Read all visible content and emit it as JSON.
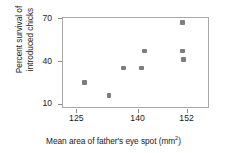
{
  "chart_data": {
    "type": "scatter",
    "title": "",
    "xlabel": "Mean area of father's eye spot (mm2)",
    "xlabel_text": "Mean area of father's eye spot (mm",
    "xlabel_sup": "2",
    "xlabel_tail": ")",
    "ylabel": "Percent survival of\nintroduced chicks",
    "xlim": [
      121.5,
      157.5
    ],
    "ylim": [
      7,
      71
    ],
    "xticks": [
      125,
      140,
      152
    ],
    "yticks": [
      10,
      40,
      70
    ],
    "xtick_labels": [
      "125",
      "140",
      "152"
    ],
    "ytick_labels": [
      "10",
      "40",
      "70"
    ],
    "grid": false,
    "legend": false,
    "marker_color": "#7d7d7d",
    "axis_color": "#a8a8a8",
    "text_color": "#1a1a1a",
    "points": [
      {
        "x": 127.0,
        "y": 25.0
      },
      {
        "x": 133.0,
        "y": 16.0
      },
      {
        "x": 136.5,
        "y": 35.0
      },
      {
        "x": 141.0,
        "y": 35.0
      },
      {
        "x": 141.7,
        "y": 47.0
      },
      {
        "x": 151.0,
        "y": 67.0
      },
      {
        "x": 151.0,
        "y": 47.0
      },
      {
        "x": 151.3,
        "y": 41.0
      }
    ]
  }
}
